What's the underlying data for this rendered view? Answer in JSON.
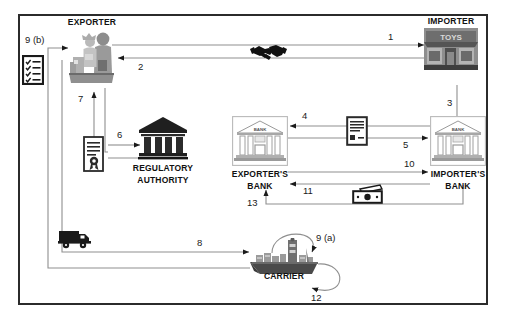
{
  "diagram": {
    "border_color": "#2b2b2b",
    "line_color": "#8a8a8a",
    "arrow_color": "#1a1a1a",
    "text_color": "#111111"
  },
  "nodes": {
    "exporter": {
      "label": "EXPORTER",
      "icon": "factory-workers-icon"
    },
    "importer": {
      "label": "IMPORTER",
      "icon": "toys-storefront-icon"
    },
    "regulatory": {
      "label_line1": "REGULATORY",
      "label_line2": "AUTHORITY",
      "icon": "government-building-icon"
    },
    "exporters_bank": {
      "label_line1": "EXPORTER'S",
      "label_line2": "BANK",
      "icon": "bank-building-icon"
    },
    "importers_bank": {
      "label_line1": "IMPORTER'S",
      "label_line2": "BANK",
      "icon": "bank-building-icon"
    },
    "carrier": {
      "label": "CARRIER",
      "icon": "cargo-ship-icon"
    }
  },
  "icons": {
    "checklist": {
      "name": "checklist-clipboard-icon"
    },
    "certificate": {
      "name": "certificate-document-icon"
    },
    "handshake": {
      "name": "handshake-icon"
    },
    "document": {
      "name": "document-icon"
    },
    "money": {
      "name": "banknote-cash-icon"
    },
    "truck": {
      "name": "delivery-truck-icon"
    }
  },
  "steps": [
    {
      "id": "1",
      "label": "1",
      "from": "exporter",
      "to": "importer",
      "description": "Exporter to Importer"
    },
    {
      "id": "2",
      "label": "2",
      "from": "importer",
      "to": "exporter",
      "description": "Importer to Exporter"
    },
    {
      "id": "3",
      "label": "3",
      "from": "importer",
      "to": "importers_bank",
      "description": "Importer to Importer's Bank"
    },
    {
      "id": "4",
      "label": "4",
      "from": "importers_bank",
      "to": "exporters_bank",
      "description": "Importer's Bank to Exporter's Bank"
    },
    {
      "id": "5",
      "label": "5",
      "from": "exporters_bank",
      "to": "importers_bank",
      "description": "Exporter's Bank to Importer's Bank"
    },
    {
      "id": "6",
      "label": "6",
      "from": "certificate",
      "to": "regulatory",
      "description": "Certificate to Regulatory Authority"
    },
    {
      "id": "7",
      "label": "7",
      "from": "certificate",
      "to": "exporter",
      "description": "Certificate to Exporter"
    },
    {
      "id": "8",
      "label": "8",
      "from": "exporter",
      "to": "carrier",
      "description": "Exporter to Carrier"
    },
    {
      "id": "9a",
      "label": "9 (a)",
      "from": "carrier",
      "to": "carrier",
      "description": "Carrier loop (a)"
    },
    {
      "id": "9b",
      "label": "9 (b)",
      "from": "carrier",
      "to": "exporter",
      "description": "Carrier to Exporter"
    },
    {
      "id": "10",
      "label": "10",
      "from": "exporters_bank",
      "to": "importers_bank",
      "description": "Exporter's Bank to Importer's Bank"
    },
    {
      "id": "11",
      "label": "11",
      "from": "importers_bank",
      "to": "exporters_bank",
      "description": "Importer's Bank to Exporter's Bank"
    },
    {
      "id": "12",
      "label": "12",
      "from": "carrier",
      "to": "carrier",
      "description": "Carrier loop"
    },
    {
      "id": "13",
      "label": "13",
      "from": "importers_bank",
      "to": "exporters_bank",
      "description": "Payment to Exporter's Bank"
    }
  ],
  "bank_sign_text": "BANK",
  "store_sign_text": "TOYS"
}
